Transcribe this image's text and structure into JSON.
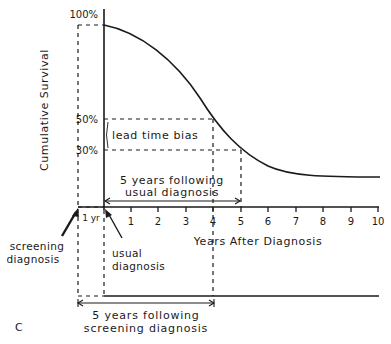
{
  "figure": {
    "panel_label": "C",
    "y_axis_label": "Cumulative Survival",
    "x_axis_label": "Years After Diagnosis",
    "y_ticks": [
      "100%",
      "50%",
      "30%"
    ],
    "x_ticks": [
      "1",
      "2",
      "3",
      "4",
      "5",
      "6",
      "7",
      "8",
      "9",
      "10"
    ],
    "lead_time_bias": "lead time bias",
    "usual_span_line1": "5 years following",
    "usual_span_line2": "usual diagnosis",
    "screening_span_line1": "5 years following",
    "screening_span_line2": "screening diagnosis",
    "one_year": "1 yr",
    "screening_diag_line1": "screening",
    "screening_diag_line2": "diagnosis",
    "usual_diag_line1": "usual",
    "usual_diag_line2": "diagnosis"
  }
}
